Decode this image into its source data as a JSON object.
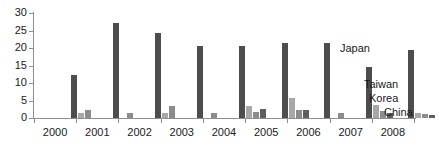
{
  "chart_data": {
    "type": "bar",
    "title": "",
    "subtitle": "",
    "xlabel": "",
    "ylabel": "",
    "ylim": [
      0,
      30
    ],
    "yticks": [
      0,
      5,
      10,
      15,
      20,
      25,
      30
    ],
    "grid": false,
    "legend_position": "inline-annotations",
    "categories": [
      "2000",
      "2001",
      "2002",
      "2003",
      "2004",
      "2005",
      "2006",
      "2007",
      "2008"
    ],
    "series": [
      {
        "name": "Japan",
        "color": "#4d4d4d",
        "values": [
          12.3,
          27.2,
          24.3,
          20.5,
          20.5,
          21.4,
          21.3,
          14.5,
          19.4
        ]
      },
      {
        "name": "Taiwan",
        "color": "#a8a8a8",
        "values": [
          1.4,
          0.0,
          1.5,
          0.0,
          3.3,
          5.8,
          0.0,
          3.6,
          1.5
        ]
      },
      {
        "name": "Korea",
        "color": "#8c8c8c",
        "values": [
          2.4,
          1.4,
          3.4,
          1.5,
          1.6,
          2.2,
          1.3,
          2.1,
          1.2
        ]
      },
      {
        "name": "China",
        "color": "#5e5e5e",
        "values": [
          0.0,
          0.0,
          0.0,
          0.0,
          2.5,
          2.3,
          0.0,
          1.5,
          1.0
        ]
      }
    ],
    "annotations": [
      {
        "text": "Japan",
        "x_px": 340,
        "y_px": 42
      },
      {
        "text": "Taiwan",
        "x_px": 364,
        "y_px": 78
      },
      {
        "text": "Korea",
        "x_px": 369,
        "y_px": 92
      },
      {
        "text": "China",
        "x_px": 384,
        "y_px": 106
      }
    ]
  },
  "colors": {
    "axis": "#8e8e8e",
    "text": "#1a1a1a",
    "background": "#ffffff"
  }
}
